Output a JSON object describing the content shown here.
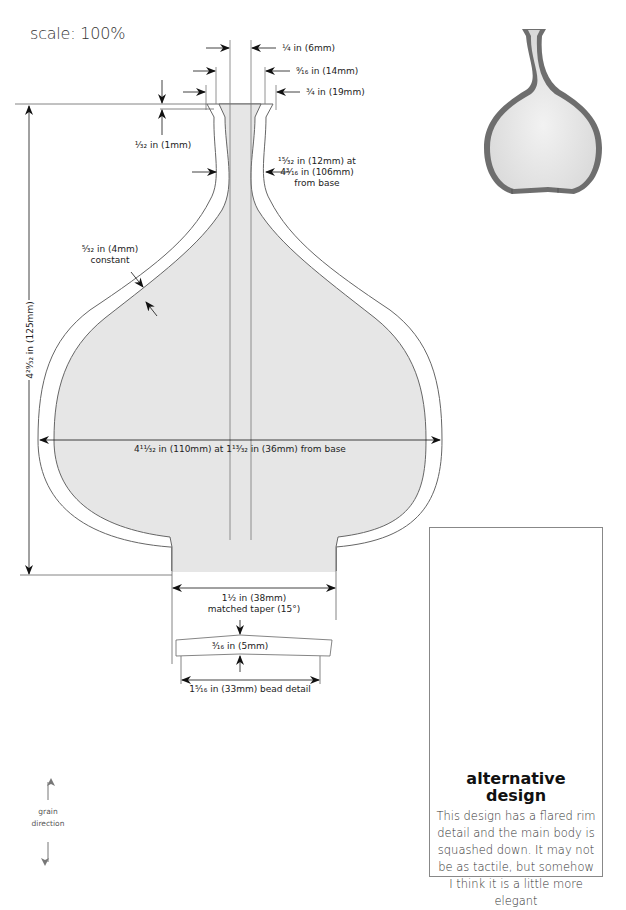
{
  "scale": {
    "label": "scale: 100%"
  },
  "dimensions": {
    "rim_inner": "¼ in (6mm)",
    "rim_mid": "⁹⁄₁₆ in (14mm)",
    "rim_outer": "¾ in (19mm)",
    "rim_lip": "¹⁄₃₂ in (1mm)",
    "neck_line1": "¹⁵⁄₃₂ in (12mm) at",
    "neck_line2": "4³⁄₁₆ in (106mm)",
    "neck_line3": "from base",
    "wall_line1": "⁵⁄₃₂ in (4mm)",
    "wall_line2": "constant",
    "height": "4²⁹⁄₃₂ in (125mm)",
    "width": "4¹¹⁄₃₂ in (110mm) at 1¹³⁄₃₂ in (36mm) from base",
    "foot_line1": "1½ in (38mm)",
    "foot_line2": "matched taper (15°)",
    "bead_thickness": "³⁄₁₆ in (5mm)",
    "bead_width": "1⁵⁄₁₆ in (33mm) bead detail"
  },
  "alternative": {
    "title_line1": "alternative",
    "title_line2": "design",
    "description": "This design has a flared rim detail and the main body is squashed down. It may not be as tactile, but somehow I think it is a little more elegant"
  },
  "grain": {
    "line1": "grain",
    "line2": "direction"
  },
  "colors": {
    "fill": "#e6e6e6",
    "line": "#666666",
    "preview_wall": "#6e6e6e",
    "preview_fill": "#e8e8e8"
  }
}
